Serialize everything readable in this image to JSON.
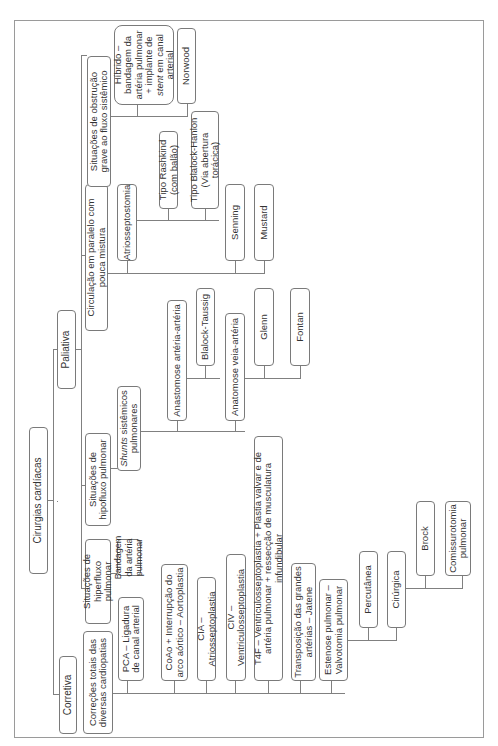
{
  "diagram": {
    "root": "Cirurgias cardíacas",
    "branches": {
      "corretiva": {
        "label": "Corretiva",
        "group": "Correções totais das diversas cardiopatias",
        "items": [
          "PCA – Ligadura de canal arterial",
          "CoAo + Interrupção do arco aórtico – Aortoplastia",
          "CIA – Atriosseptoplastia",
          "CIV – Ventriculosseptoplastia",
          "T4F – Ventriculosseptoplastia + Plastia valvar e de artéria pulmonar + ressecção de musculatura infundibular",
          "Transposição das grandes artérias – Jatene",
          "Estenose pulmonar – Valvotomia pulmonar"
        ],
        "estenose_children": [
          "Percutânea",
          "Cirúrgica"
        ],
        "cirurgica_children": [
          "Brock",
          "Comissurotomia pulmonar"
        ]
      },
      "paliativa": {
        "label": "Paliativa",
        "hiperfluxo": {
          "label": "Situações de hiperfluxo pulmonar",
          "children": [
            "Bandagem da artéria pulmonar"
          ]
        },
        "hipofluxo": {
          "label": "Situações de hipofluxo pulmonar",
          "shunts": "Shunts sistêmicos pulmonares",
          "shunts_italic": "Shunts",
          "shunts_rest": " sistêmicos pulmonares",
          "arteria_arteria": "Anastomose artéria-artéria",
          "arteria_children": [
            "Blalock-Taussig"
          ],
          "veia_arteria": "Anatomose veia-artéria",
          "veia_children": [
            "Glenn",
            "Fontan"
          ]
        },
        "paralelo": {
          "label": "Circulação em paralelo com pouca mistura",
          "atrio": "Atriosseptostomia",
          "atrio_children": [
            "Tipo Rashkind (com balão)",
            "Tipo Blalock-Hanlon (Via abertura torácica)"
          ],
          "others": [
            "Senning",
            "Mustard"
          ]
        },
        "obstrucao": {
          "label": "Situações de obstrução grave ao fluxo sistêmico",
          "hibrido_pre": "Híbrido – bandagem da artéria pulmonar + implante de ",
          "hibrido_italic": "stent",
          "hibrido_post": " em canal arterial",
          "children_text": "Híbrido – bandagem da artéria pulmonar + implante de stent em canal arterial",
          "norwood": "Norwood"
        }
      }
    }
  },
  "colors": {
    "border": "#7a7a7a",
    "line": "#808080",
    "text": "#333333",
    "frame": "#9a9a9a"
  }
}
